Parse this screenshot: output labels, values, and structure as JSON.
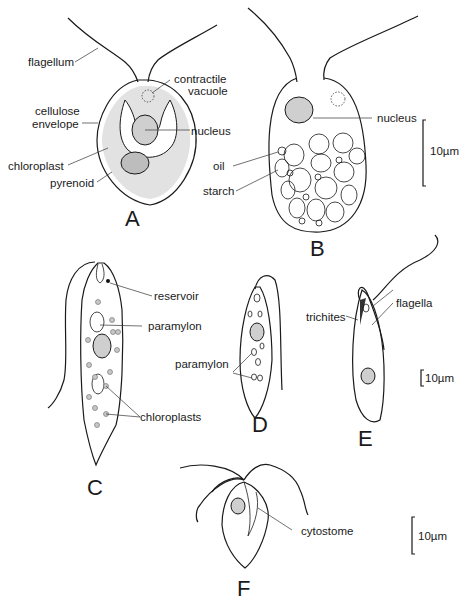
{
  "figure": {
    "panels": [
      {
        "id": "A",
        "letter": "A",
        "labels": {
          "flagellum": "flagellum",
          "contractile_vacuole_line1": "contractile",
          "contractile_vacuole_line2": "vacuole",
          "cellulose_envelope_line1": "cellulose",
          "cellulose_envelope_line2": "envelope",
          "nucleus": "nucleus",
          "chloroplast": "chloroplast",
          "pyrenoid": "pyrenoid"
        }
      },
      {
        "id": "B",
        "letter": "B",
        "labels": {
          "nucleus": "nucleus",
          "oil": "oil",
          "starch": "starch"
        },
        "scale_bar": "10µm"
      },
      {
        "id": "C",
        "letter": "C",
        "labels": {
          "reservoir": "reservoir",
          "paramylon": "paramylon",
          "chloroplasts": "chloroplasts"
        }
      },
      {
        "id": "D",
        "letter": "D",
        "labels": {
          "paramylon": "paramylon"
        }
      },
      {
        "id": "E",
        "letter": "E",
        "labels": {
          "trichites": "trichites",
          "flagella": "flagella"
        },
        "scale_bar": "10µm"
      },
      {
        "id": "F",
        "letter": "F",
        "labels": {
          "cytostome": "cytostome"
        },
        "scale_bar": "10µm"
      }
    ]
  }
}
